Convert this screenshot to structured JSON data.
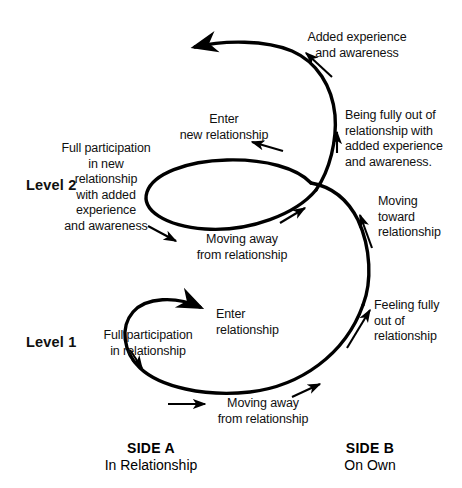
{
  "diagram": {
    "stroke_color": "#000000",
    "background_color": "#ffffff",
    "levels": [
      {
        "id": "level-2",
        "label": "Level 2"
      },
      {
        "id": "level-1",
        "label": "Level 1"
      }
    ],
    "sides": [
      {
        "id": "side-a",
        "title": "SIDE A",
        "subtitle": "In Relationship"
      },
      {
        "id": "side-b",
        "title": "SIDE B",
        "subtitle": "On Own"
      }
    ],
    "annotations": [
      {
        "id": "added-experience",
        "text": "Added experience\nand awareness"
      },
      {
        "id": "being-fully-out",
        "text": "Being fully out of\nrelationship with\nadded experience\nand awareness."
      },
      {
        "id": "enter-new-relationship",
        "text": "Enter\nnew relationship"
      },
      {
        "id": "full-participation-new",
        "text": "Full participation\nin new\nrelationship\nwith added\nexperience\nand awareness"
      },
      {
        "id": "moving-away-upper",
        "text": "Moving away\nfrom relationship"
      },
      {
        "id": "moving-toward",
        "text": "Moving\ntoward\nrelationship"
      },
      {
        "id": "feeling-fully-out",
        "text": "Feeling fully\nout of\nrelationship"
      },
      {
        "id": "enter-relationship",
        "text": "Enter\nrelationship"
      },
      {
        "id": "full-participation",
        "text": "Full participation\nin relationship"
      },
      {
        "id": "moving-away-lower",
        "text": "Moving away\nfrom relationship"
      }
    ]
  }
}
